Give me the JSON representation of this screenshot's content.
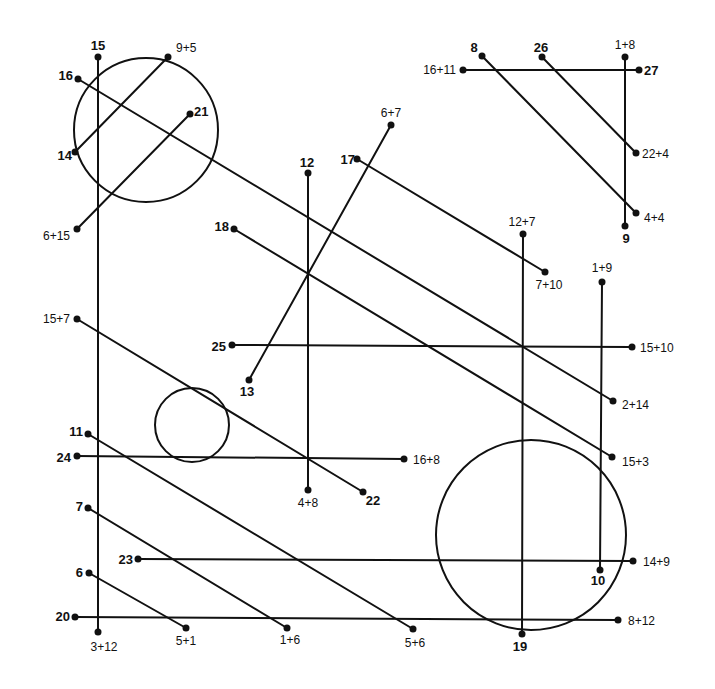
{
  "puzzle": {
    "type": "math connect-the-lines puzzle",
    "ink_color": "#111111",
    "background_color": "#ffffff"
  },
  "circles": [
    {
      "name": "circle-top-left",
      "cx": 146,
      "cy": 130,
      "r": 72
    },
    {
      "name": "circle-small-middle",
      "cx": 192,
      "cy": 425,
      "r": 37
    },
    {
      "name": "circle-large-bottom-right",
      "cx": 531,
      "cy": 535,
      "r": 95
    }
  ],
  "points": [
    {
      "id": "p15",
      "label": "15",
      "bold": true,
      "x": 98,
      "y": 57,
      "lx": 98,
      "ly": 50,
      "anchor": "middle"
    },
    {
      "id": "p9p5",
      "label": "9+5",
      "bold": false,
      "x": 168,
      "y": 57,
      "lx": 176,
      "ly": 52,
      "anchor": "start"
    },
    {
      "id": "p16",
      "label": "16",
      "bold": true,
      "x": 78,
      "y": 79,
      "lx": 73,
      "ly": 80,
      "anchor": "end"
    },
    {
      "id": "p21",
      "label": "21",
      "bold": true,
      "x": 190,
      "y": 114,
      "lx": 194,
      "ly": 116,
      "anchor": "start"
    },
    {
      "id": "p14",
      "label": "14",
      "bold": true,
      "x": 75,
      "y": 152,
      "lx": 72,
      "ly": 160,
      "anchor": "end"
    },
    {
      "id": "p6p15",
      "label": "6+15",
      "bold": false,
      "x": 77,
      "y": 229,
      "lx": 70,
      "ly": 240,
      "anchor": "end"
    },
    {
      "id": "p8",
      "label": "8",
      "bold": true,
      "x": 482,
      "y": 56,
      "lx": 474,
      "ly": 52,
      "anchor": "middle"
    },
    {
      "id": "p26",
      "label": "26",
      "bold": true,
      "x": 542,
      "y": 57,
      "lx": 541,
      "ly": 52,
      "anchor": "middle"
    },
    {
      "id": "p1p8",
      "label": "1+8",
      "bold": false,
      "x": 625,
      "y": 57,
      "lx": 625,
      "ly": 49,
      "anchor": "middle"
    },
    {
      "id": "p16p11",
      "label": "16+11",
      "bold": false,
      "x": 463,
      "y": 70,
      "lx": 456,
      "ly": 74,
      "anchor": "end"
    },
    {
      "id": "p27",
      "label": "27",
      "bold": true,
      "x": 639,
      "y": 70,
      "lx": 644,
      "ly": 75,
      "anchor": "start"
    },
    {
      "id": "p22p4",
      "label": "22+4",
      "bold": false,
      "x": 636,
      "y": 153,
      "lx": 642,
      "ly": 158,
      "anchor": "start"
    },
    {
      "id": "p4p4",
      "label": "4+4",
      "bold": false,
      "x": 636,
      "y": 213,
      "lx": 644,
      "ly": 222,
      "anchor": "start"
    },
    {
      "id": "p9",
      "label": "9",
      "bold": true,
      "x": 625,
      "y": 226,
      "lx": 626,
      "ly": 243,
      "anchor": "middle"
    },
    {
      "id": "p6p7",
      "label": "6+7",
      "bold": false,
      "x": 391,
      "y": 125,
      "lx": 391,
      "ly": 117,
      "anchor": "middle"
    },
    {
      "id": "p12",
      "label": "12",
      "bold": true,
      "x": 308,
      "y": 173,
      "lx": 307,
      "ly": 167,
      "anchor": "middle"
    },
    {
      "id": "p17",
      "label": "17",
      "bold": true,
      "x": 357,
      "y": 159,
      "lx": 355,
      "ly": 164,
      "anchor": "end"
    },
    {
      "id": "p18",
      "label": "18",
      "bold": true,
      "x": 234,
      "y": 229,
      "lx": 229,
      "ly": 231,
      "anchor": "end"
    },
    {
      "id": "p12p7",
      "label": "12+7",
      "bold": false,
      "x": 523,
      "y": 234,
      "lx": 522,
      "ly": 226,
      "anchor": "middle"
    },
    {
      "id": "p7p10",
      "label": "7+10",
      "bold": false,
      "x": 545,
      "y": 272,
      "lx": 549,
      "ly": 289,
      "anchor": "middle"
    },
    {
      "id": "p1p9",
      "label": "1+9",
      "bold": false,
      "x": 602,
      "y": 282,
      "lx": 602,
      "ly": 272,
      "anchor": "middle"
    },
    {
      "id": "p15p7",
      "label": "15+7",
      "bold": false,
      "x": 77,
      "y": 319,
      "lx": 70,
      "ly": 323,
      "anchor": "end"
    },
    {
      "id": "p25",
      "label": "25",
      "bold": true,
      "x": 232,
      "y": 345,
      "lx": 226,
      "ly": 351,
      "anchor": "end"
    },
    {
      "id": "p15p10",
      "label": "15+10",
      "bold": false,
      "x": 632,
      "y": 347,
      "lx": 640,
      "ly": 352,
      "anchor": "start"
    },
    {
      "id": "p13",
      "label": "13",
      "bold": true,
      "x": 249,
      "y": 380,
      "lx": 247,
      "ly": 396,
      "anchor": "middle"
    },
    {
      "id": "p2p14",
      "label": "2+14",
      "bold": false,
      "x": 613,
      "y": 401,
      "lx": 622,
      "ly": 409,
      "anchor": "start"
    },
    {
      "id": "p11",
      "label": "11",
      "bold": true,
      "x": 88,
      "y": 434,
      "lx": 83,
      "ly": 436,
      "anchor": "end"
    },
    {
      "id": "p24",
      "label": "24",
      "bold": true,
      "x": 77,
      "y": 456,
      "lx": 71,
      "ly": 462,
      "anchor": "end"
    },
    {
      "id": "p16p8",
      "label": "16+8",
      "bold": false,
      "x": 404,
      "y": 459,
      "lx": 413,
      "ly": 464,
      "anchor": "start"
    },
    {
      "id": "p15p3",
      "label": "15+3",
      "bold": false,
      "x": 612,
      "y": 457,
      "lx": 622,
      "ly": 466,
      "anchor": "start"
    },
    {
      "id": "p4p8",
      "label": "4+8",
      "bold": false,
      "x": 308,
      "y": 490,
      "lx": 308,
      "ly": 507,
      "anchor": "middle"
    },
    {
      "id": "p22",
      "label": "22",
      "bold": true,
      "x": 363,
      "y": 492,
      "lx": 373,
      "ly": 505,
      "anchor": "middle"
    },
    {
      "id": "p7",
      "label": "7",
      "bold": true,
      "x": 88,
      "y": 508,
      "lx": 83,
      "ly": 511,
      "anchor": "end"
    },
    {
      "id": "p23",
      "label": "23",
      "bold": true,
      "x": 138,
      "y": 559,
      "lx": 133,
      "ly": 564,
      "anchor": "end"
    },
    {
      "id": "p14p9",
      "label": "14+9",
      "bold": false,
      "x": 633,
      "y": 561,
      "lx": 643,
      "ly": 566,
      "anchor": "start"
    },
    {
      "id": "p10",
      "label": "10",
      "bold": true,
      "x": 600,
      "y": 570,
      "lx": 598,
      "ly": 585,
      "anchor": "middle"
    },
    {
      "id": "p6",
      "label": "6",
      "bold": true,
      "x": 89,
      "y": 573,
      "lx": 83,
      "ly": 577,
      "anchor": "end"
    },
    {
      "id": "p20",
      "label": "20",
      "bold": true,
      "x": 75,
      "y": 617,
      "lx": 70,
      "ly": 621,
      "anchor": "end"
    },
    {
      "id": "p8p12",
      "label": "8+12",
      "bold": false,
      "x": 618,
      "y": 620,
      "lx": 628,
      "ly": 625,
      "anchor": "start"
    },
    {
      "id": "p3p12",
      "label": "3+12",
      "bold": false,
      "x": 98,
      "y": 632,
      "lx": 104,
      "ly": 651,
      "anchor": "middle"
    },
    {
      "id": "p5p1",
      "label": "5+1",
      "bold": false,
      "x": 186,
      "y": 628,
      "lx": 186,
      "ly": 645,
      "anchor": "middle"
    },
    {
      "id": "p1p6",
      "label": "1+6",
      "bold": false,
      "x": 287,
      "y": 628,
      "lx": 290,
      "ly": 644,
      "anchor": "middle"
    },
    {
      "id": "p5p6",
      "label": "5+6",
      "bold": false,
      "x": 413,
      "y": 629,
      "lx": 415,
      "ly": 647,
      "anchor": "middle"
    },
    {
      "id": "p19",
      "label": "19",
      "bold": true,
      "x": 522,
      "y": 634,
      "lx": 520,
      "ly": 651,
      "anchor": "middle"
    }
  ],
  "segments": [
    {
      "from": "p15",
      "to": "p3p12"
    },
    {
      "from": "p9p5",
      "to": "p14"
    },
    {
      "from": "p16",
      "to": "p2p14"
    },
    {
      "from": "p21",
      "to": "p6p15"
    },
    {
      "from": "p8",
      "to": "p4p4"
    },
    {
      "from": "p26",
      "to": "p22p4"
    },
    {
      "from": "p1p8",
      "to": "p9"
    },
    {
      "from": "p16p11",
      "to": "p27"
    },
    {
      "from": "p6p7",
      "to": "p13"
    },
    {
      "from": "p12",
      "to": "p4p8"
    },
    {
      "from": "p17",
      "to": "p7p10"
    },
    {
      "from": "p18",
      "to": "p15p3"
    },
    {
      "from": "p12p7",
      "to": "p19"
    },
    {
      "from": "p1p9",
      "to": "p10"
    },
    {
      "from": "p15p7",
      "to": "p22"
    },
    {
      "from": "p25",
      "to": "p15p10"
    },
    {
      "from": "p11",
      "to": "p5p6"
    },
    {
      "from": "p24",
      "to": "p16p8"
    },
    {
      "from": "p7",
      "to": "p1p6"
    },
    {
      "from": "p23",
      "to": "p14p9"
    },
    {
      "from": "p6",
      "to": "p5p1"
    },
    {
      "from": "p20",
      "to": "p8p12"
    }
  ]
}
